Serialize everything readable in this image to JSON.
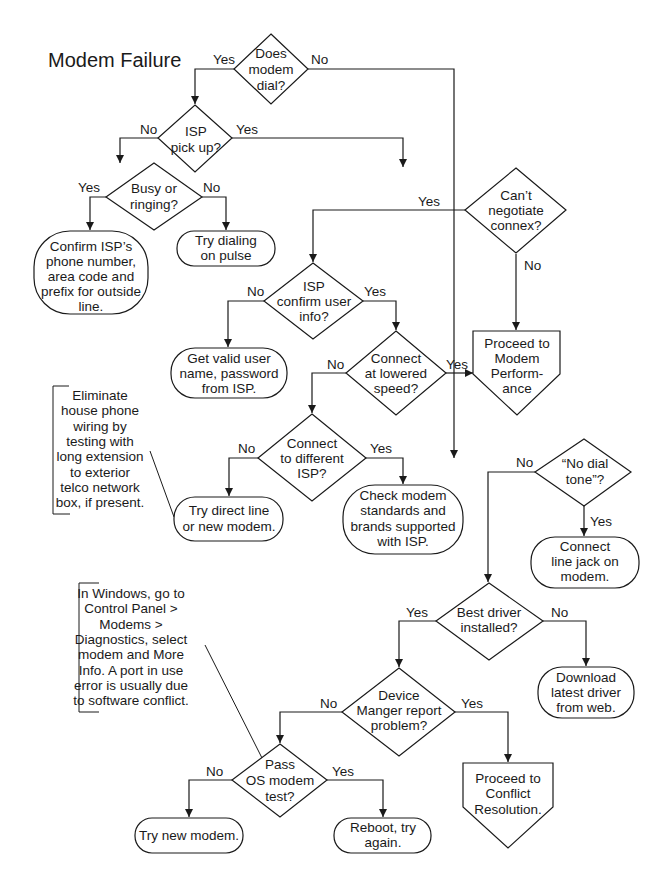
{
  "title": "Modem Failure",
  "colors": {
    "ink": "#1a1a1a",
    "background": "#ffffff"
  },
  "nodes": {
    "does_modem_dial": {
      "type": "decision",
      "lines": [
        "Does",
        "modem",
        "dial?"
      ]
    },
    "isp_pick_up": {
      "type": "decision",
      "lines": [
        "ISP",
        "pick up?"
      ]
    },
    "busy_or_ringing": {
      "type": "decision",
      "lines": [
        "Busy or",
        "ringing?"
      ]
    },
    "confirm_isp_number": {
      "type": "terminal",
      "lines": [
        "Confirm ISP’s",
        "phone number,",
        "area code and",
        "prefix for outside",
        "line."
      ]
    },
    "try_dialing_pulse": {
      "type": "terminal",
      "lines": [
        "Try dialing",
        "on pulse"
      ]
    },
    "cant_negotiate": {
      "type": "decision",
      "lines": [
        "Can’t",
        "negotiate",
        "connex?"
      ]
    },
    "isp_confirm_user": {
      "type": "decision",
      "lines": [
        "ISP",
        "confirm user",
        "info?"
      ]
    },
    "get_valid_user": {
      "type": "terminal",
      "lines": [
        "Get valid user",
        "name, password",
        "from ISP."
      ]
    },
    "connect_lowered_speed": {
      "type": "decision",
      "lines": [
        "Connect",
        "at lowered",
        "speed?"
      ]
    },
    "proceed_modem_performance": {
      "type": "offpage",
      "lines": [
        "Proceed to",
        "Modem",
        "Perform-",
        "ance"
      ]
    },
    "connect_different_isp": {
      "type": "decision",
      "lines": [
        "Connect",
        "to different",
        "ISP?"
      ]
    },
    "try_direct_line": {
      "type": "terminal",
      "lines": [
        "Try direct line",
        "or new modem."
      ]
    },
    "check_modem_standards": {
      "type": "terminal",
      "lines": [
        "Check modem",
        "standards and",
        "brands supported",
        "with ISP."
      ]
    },
    "no_dial_tone": {
      "type": "decision",
      "lines": [
        "“No dial",
        "tone”?"
      ]
    },
    "connect_line_jack": {
      "type": "terminal",
      "lines": [
        "Connect",
        "line jack on",
        "modem."
      ]
    },
    "best_driver": {
      "type": "decision",
      "lines": [
        "Best driver",
        "installed?"
      ]
    },
    "download_driver": {
      "type": "terminal",
      "lines": [
        "Download",
        "latest driver",
        "from web."
      ]
    },
    "device_manager": {
      "type": "decision",
      "lines": [
        "Device",
        "Manger report",
        "problem?"
      ]
    },
    "proceed_conflict": {
      "type": "offpage",
      "lines": [
        "Proceed to",
        "Conflict",
        "Resolution."
      ]
    },
    "pass_os_test": {
      "type": "decision",
      "lines": [
        "Pass",
        "OS modem",
        "test?"
      ]
    },
    "try_new_modem": {
      "type": "terminal",
      "lines": [
        "Try new modem."
      ]
    },
    "reboot": {
      "type": "terminal",
      "lines": [
        "Reboot, try",
        "again."
      ]
    }
  },
  "annotations": {
    "house_wiring": {
      "lines": [
        "Eliminate",
        "house phone",
        "wiring by",
        "testing with",
        "long extension",
        "to exterior",
        "telco network",
        "box, if present."
      ]
    },
    "windows_diag": {
      "lines": [
        "In Windows, go to",
        "Control Panel >",
        "Modems >",
        "Diagnostics, select",
        "modem and More",
        "Info. A port in use",
        "error is usually due",
        "to software conflict."
      ]
    }
  },
  "edge_labels": {
    "dial_yes": "Yes",
    "dial_no": "No",
    "pick_no": "No",
    "pick_yes": "Yes",
    "busy_yes": "Yes",
    "busy_no": "No",
    "negotiate_yes": "Yes",
    "negotiate_no": "No",
    "confirm_no": "No",
    "confirm_yes": "Yes",
    "lowered_no": "No",
    "lowered_yes": "Yes",
    "different_no": "No",
    "different_yes": "Yes",
    "dialtone_no": "No",
    "dialtone_yes": "Yes",
    "driver_yes": "Yes",
    "driver_no": "No",
    "devmgr_no": "No",
    "devmgr_yes": "Yes",
    "ostest_no": "No",
    "ostest_yes": "Yes"
  }
}
